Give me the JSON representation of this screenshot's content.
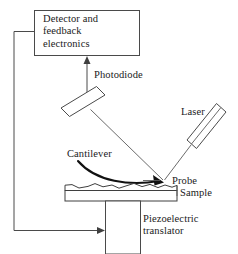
{
  "figure": {
    "background_color": "#ffffff",
    "line_color": "#4a4a4a",
    "text_color": "#1a1a1a",
    "width": 238,
    "height": 254
  },
  "labels": {
    "detector_box": "Detector and\nfeedback\nelectronics",
    "photodiode": "Photodiode",
    "laser": "Laser",
    "cantilever": "Cantilever",
    "probe": "Probe",
    "sample": "Sample",
    "piezo": "Piezoelectric\ntranslator"
  },
  "components": {
    "detector_box": {
      "x": 34,
      "y": 10,
      "width": 106,
      "height": 46
    },
    "photodiode_plate": {
      "center_x": 83,
      "center_y": 101,
      "length": 36,
      "thickness": 12,
      "angle_deg": -45
    },
    "laser_body": {
      "center_x": 206,
      "center_y": 128,
      "length": 48,
      "thickness": 13,
      "angle_deg": -50
    },
    "sample_slab": {
      "x": 65,
      "y": 184,
      "width": 112,
      "height": 17
    },
    "piezo_box": {
      "x": 105,
      "y": 201,
      "width": 36,
      "height": 52
    }
  },
  "beams": {
    "laser_to_probe": {
      "x1": 190,
      "y1": 145,
      "x2": 164,
      "y2": 181
    },
    "probe_to_photodiode": {
      "x1": 163,
      "y1": 180,
      "x2": 92,
      "y2": 110
    },
    "photodiode_to_detector": {
      "x1": 87,
      "y1": 92,
      "x2": 87,
      "y2": 57
    },
    "feedback_loop": "detector-left -> down-left -> bottom -> piezo-left"
  }
}
